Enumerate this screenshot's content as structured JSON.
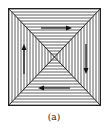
{
  "figure": {
    "caption": "(a)",
    "colors": {
      "line": "#222222",
      "background": "#ffffff"
    },
    "triangles": [
      {
        "name": "top",
        "hatch": "horizontal",
        "arrow": "right"
      },
      {
        "name": "right",
        "hatch": "vertical",
        "arrow": "down"
      },
      {
        "name": "bottom",
        "hatch": "horizontal",
        "arrow": "left"
      },
      {
        "name": "left",
        "hatch": "vertical",
        "arrow": "up"
      }
    ]
  }
}
